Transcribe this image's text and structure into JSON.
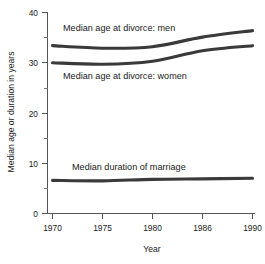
{
  "chart_data": {
    "type": "line",
    "title": "",
    "xlabel": "Year",
    "ylabel": "Median age or duration in years",
    "x": [
      1970,
      1975,
      1980,
      1986,
      1990
    ],
    "xtick_labels": [
      "1970",
      "1975",
      "1980",
      "1986",
      "1990"
    ],
    "ytick_labels": [
      "0",
      "10",
      "20",
      "30",
      "40"
    ],
    "yticks": [
      0,
      10,
      20,
      30,
      40
    ],
    "yminor_ticks": [
      5,
      15,
      25,
      35
    ],
    "ylim": [
      0,
      40
    ],
    "xlim": [
      1970,
      1990
    ],
    "grid": false,
    "legend": "inline-labels",
    "line_color": "#3a3a3a",
    "axis_color": "#555555",
    "background": "#ffffff",
    "series": [
      {
        "name": "Median age at divorce:  men",
        "values": [
          33.4,
          32.9,
          33.2,
          35.1,
          36.4
        ]
      },
      {
        "name": "Median age at divorce:  women",
        "values": [
          30.0,
          29.7,
          30.3,
          32.4,
          33.4
        ]
      },
      {
        "name": "Median duration of marriage",
        "values": [
          6.6,
          6.5,
          6.8,
          6.9,
          7.0
        ]
      }
    ],
    "annotations": [
      {
        "text": "Median age at divorce:  men",
        "x": 1977.3,
        "y": 37.4
      },
      {
        "text": "Median age at divorce:  women",
        "x": 1977.3,
        "y": 27.6
      },
      {
        "text": "Median duration of marriage",
        "x": 1978.5,
        "y": 9.3
      }
    ]
  }
}
